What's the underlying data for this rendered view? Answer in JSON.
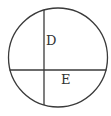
{
  "diagram": {
    "type": "circle-with-chords",
    "circle": {
      "cx": 58,
      "cy": 57.5,
      "r": 49.5
    },
    "chords": [
      {
        "name": "vertical",
        "x1": 44,
        "y1": 10,
        "x2": 44,
        "y2": 105
      },
      {
        "name": "horizontal",
        "x1": 9,
        "y1": 70,
        "x2": 107,
        "y2": 70
      }
    ],
    "labels": [
      {
        "text": "D",
        "x": 46,
        "y": 45
      },
      {
        "text": "E",
        "x": 61,
        "y": 84
      }
    ],
    "stroke_color": "#3a3a3a"
  }
}
